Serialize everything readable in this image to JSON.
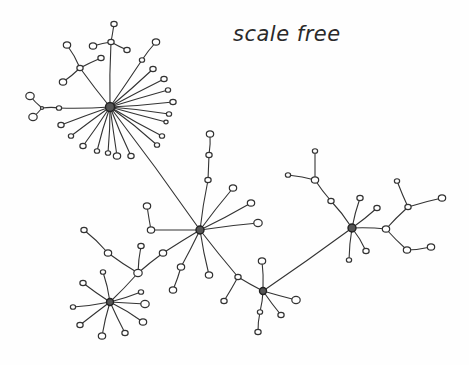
{
  "diagram": {
    "title": "scale free",
    "style": {
      "ink": "#333333",
      "paper": "#fefefe"
    },
    "hubs": [
      {
        "id": "h1",
        "x": 110,
        "y": 107,
        "r": 4.5
      },
      {
        "id": "h2",
        "x": 200,
        "y": 230,
        "r": 4
      },
      {
        "id": "h3",
        "x": 110,
        "y": 302,
        "r": 3.5
      },
      {
        "id": "h4",
        "x": 263,
        "y": 291,
        "r": 3.5
      },
      {
        "id": "h5",
        "x": 352,
        "y": 228,
        "r": 4
      }
    ],
    "nodes": [
      {
        "id": "a1",
        "x": 114,
        "y": 24,
        "r": 3
      },
      {
        "id": "a2",
        "x": 111,
        "y": 42,
        "r": 3
      },
      {
        "id": "a3",
        "x": 93,
        "y": 46,
        "r": 3.5
      },
      {
        "id": "a4",
        "x": 127,
        "y": 50,
        "r": 3
      },
      {
        "id": "a5",
        "x": 67,
        "y": 45,
        "r": 3.5
      },
      {
        "id": "a6",
        "x": 80,
        "y": 68,
        "r": 3
      },
      {
        "id": "a7",
        "x": 101,
        "y": 58,
        "r": 3
      },
      {
        "id": "a8",
        "x": 63,
        "y": 82,
        "r": 3.5
      },
      {
        "id": "a9",
        "x": 156,
        "y": 42,
        "r": 3.5
      },
      {
        "id": "a10",
        "x": 142,
        "y": 60,
        "r": 2.5
      },
      {
        "id": "a11",
        "x": 153,
        "y": 69,
        "r": 3
      },
      {
        "id": "a12",
        "x": 164,
        "y": 79,
        "r": 3
      },
      {
        "id": "a13",
        "x": 168,
        "y": 90,
        "r": 2.5
      },
      {
        "id": "a14",
        "x": 173,
        "y": 102,
        "r": 3
      },
      {
        "id": "a15",
        "x": 169,
        "y": 114,
        "r": 2.5
      },
      {
        "id": "a16",
        "x": 166,
        "y": 122,
        "r": 2
      },
      {
        "id": "a17",
        "x": 162,
        "y": 136,
        "r": 2.5
      },
      {
        "id": "a18",
        "x": 157,
        "y": 145,
        "r": 2.5
      },
      {
        "id": "a19",
        "x": 131,
        "y": 156,
        "r": 3
      },
      {
        "id": "a20",
        "x": 117,
        "y": 156,
        "r": 3.5
      },
      {
        "id": "a21",
        "x": 108,
        "y": 153,
        "r": 2.5
      },
      {
        "id": "a22",
        "x": 97,
        "y": 151,
        "r": 2.5
      },
      {
        "id": "a23",
        "x": 83,
        "y": 146,
        "r": 3
      },
      {
        "id": "a24",
        "x": 71,
        "y": 136,
        "r": 2.5
      },
      {
        "id": "a25",
        "x": 61,
        "y": 125,
        "r": 3
      },
      {
        "id": "a26",
        "x": 59,
        "y": 108,
        "r": 2.5
      },
      {
        "id": "a27",
        "x": 42,
        "y": 108,
        "r": 1.5
      },
      {
        "id": "a28",
        "x": 30,
        "y": 96,
        "r": 4
      },
      {
        "id": "a29",
        "x": 33,
        "y": 117,
        "r": 4
      },
      {
        "id": "b1",
        "x": 210,
        "y": 134,
        "r": 3.5
      },
      {
        "id": "b2",
        "x": 209,
        "y": 155,
        "r": 3
      },
      {
        "id": "b3",
        "x": 208,
        "y": 180,
        "r": 3
      },
      {
        "id": "b4",
        "x": 233,
        "y": 188,
        "r": 3.5
      },
      {
        "id": "b5",
        "x": 251,
        "y": 203,
        "r": 3.5
      },
      {
        "id": "b6",
        "x": 258,
        "y": 223,
        "r": 4
      },
      {
        "id": "b7",
        "x": 147,
        "y": 206,
        "r": 3.5
      },
      {
        "id": "b8",
        "x": 151,
        "y": 230,
        "r": 3.5
      },
      {
        "id": "b9",
        "x": 141,
        "y": 246,
        "r": 2.5
      },
      {
        "id": "b10",
        "x": 163,
        "y": 253,
        "r": 3.5
      },
      {
        "id": "b11",
        "x": 181,
        "y": 267,
        "r": 3.5
      },
      {
        "id": "b12",
        "x": 173,
        "y": 290,
        "r": 3.5
      },
      {
        "id": "b13",
        "x": 209,
        "y": 275,
        "r": 3.5
      },
      {
        "id": "b14",
        "x": 238,
        "y": 277,
        "r": 3
      },
      {
        "id": "b15",
        "x": 224,
        "y": 301,
        "r": 3
      },
      {
        "id": "c1",
        "x": 138,
        "y": 273,
        "r": 4
      },
      {
        "id": "c2",
        "x": 108,
        "y": 253,
        "r": 3.5
      },
      {
        "id": "c3",
        "x": 84,
        "y": 230,
        "r": 3
      },
      {
        "id": "c4",
        "x": 141,
        "y": 246,
        "r": 3
      },
      {
        "id": "c5",
        "x": 103,
        "y": 272,
        "r": 2.5
      },
      {
        "id": "c6",
        "x": 83,
        "y": 283,
        "r": 3
      },
      {
        "id": "c7",
        "x": 73,
        "y": 307,
        "r": 2.5
      },
      {
        "id": "c8",
        "x": 80,
        "y": 325,
        "r": 3
      },
      {
        "id": "c9",
        "x": 102,
        "y": 336,
        "r": 3.5
      },
      {
        "id": "c10",
        "x": 125,
        "y": 333,
        "r": 3
      },
      {
        "id": "c11",
        "x": 143,
        "y": 322,
        "r": 3.5
      },
      {
        "id": "c12",
        "x": 145,
        "y": 304,
        "r": 4
      },
      {
        "id": "c13",
        "x": 141,
        "y": 292,
        "r": 2.5
      },
      {
        "id": "d1",
        "x": 262,
        "y": 261,
        "r": 3.5
      },
      {
        "id": "d2",
        "x": 296,
        "y": 300,
        "r": 4
      },
      {
        "id": "d3",
        "x": 281,
        "y": 315,
        "r": 3
      },
      {
        "id": "d4",
        "x": 260,
        "y": 312,
        "r": 2.5
      },
      {
        "id": "d5",
        "x": 258,
        "y": 332,
        "r": 3
      },
      {
        "id": "e1",
        "x": 315,
        "y": 151,
        "r": 2.5
      },
      {
        "id": "e2",
        "x": 315,
        "y": 180,
        "r": 3.5
      },
      {
        "id": "e3",
        "x": 288,
        "y": 175,
        "r": 2.5
      },
      {
        "id": "e4",
        "x": 331,
        "y": 201,
        "r": 3
      },
      {
        "id": "e5",
        "x": 360,
        "y": 198,
        "r": 3
      },
      {
        "id": "e6",
        "x": 377,
        "y": 208,
        "r": 3
      },
      {
        "id": "e7",
        "x": 386,
        "y": 229,
        "r": 3.5
      },
      {
        "id": "e8",
        "x": 408,
        "y": 207,
        "r": 3
      },
      {
        "id": "e9",
        "x": 397,
        "y": 181,
        "r": 2.5
      },
      {
        "id": "e10",
        "x": 442,
        "y": 198,
        "r": 3.5
      },
      {
        "id": "e11",
        "x": 407,
        "y": 250,
        "r": 3.5
      },
      {
        "id": "e12",
        "x": 431,
        "y": 247,
        "r": 3.5
      },
      {
        "id": "e13",
        "x": 366,
        "y": 251,
        "r": 3
      },
      {
        "id": "e14",
        "x": 349,
        "y": 260,
        "r": 2.5
      }
    ],
    "edges": [
      [
        "h1",
        "a2"
      ],
      [
        "a2",
        "a1"
      ],
      [
        "a2",
        "a3"
      ],
      [
        "a2",
        "a4"
      ],
      [
        "h1",
        "a6"
      ],
      [
        "a6",
        "a5"
      ],
      [
        "a6",
        "a7"
      ],
      [
        "a6",
        "a8"
      ],
      [
        "h1",
        "a10"
      ],
      [
        "a10",
        "a9"
      ],
      [
        "h1",
        "a11"
      ],
      [
        "h1",
        "a12"
      ],
      [
        "h1",
        "a13"
      ],
      [
        "h1",
        "a14"
      ],
      [
        "h1",
        "a15"
      ],
      [
        "h1",
        "a16"
      ],
      [
        "h1",
        "a17"
      ],
      [
        "h1",
        "a18"
      ],
      [
        "h1",
        "a19"
      ],
      [
        "h1",
        "a20"
      ],
      [
        "h1",
        "a21"
      ],
      [
        "h1",
        "a22"
      ],
      [
        "h1",
        "a23"
      ],
      [
        "h1",
        "a24"
      ],
      [
        "h1",
        "a25"
      ],
      [
        "h1",
        "a26"
      ],
      [
        "a26",
        "a27"
      ],
      [
        "a27",
        "a28"
      ],
      [
        "a27",
        "a29"
      ],
      [
        "h1",
        "h2"
      ],
      [
        "h2",
        "b3"
      ],
      [
        "b3",
        "b2"
      ],
      [
        "b2",
        "b1"
      ],
      [
        "h2",
        "b4"
      ],
      [
        "h2",
        "b5"
      ],
      [
        "h2",
        "b6"
      ],
      [
        "h2",
        "b8"
      ],
      [
        "b8",
        "b7"
      ],
      [
        "h2",
        "b10"
      ],
      [
        "b10",
        "c1"
      ],
      [
        "h2",
        "b11"
      ],
      [
        "b11",
        "b12"
      ],
      [
        "h2",
        "b13"
      ],
      [
        "h2",
        "b14"
      ],
      [
        "b14",
        "b15"
      ],
      [
        "b14",
        "h4"
      ],
      [
        "c1",
        "c2"
      ],
      [
        "c2",
        "c3"
      ],
      [
        "c1",
        "c4"
      ],
      [
        "c1",
        "h3"
      ],
      [
        "h3",
        "c5"
      ],
      [
        "h3",
        "c6"
      ],
      [
        "h3",
        "c7"
      ],
      [
        "h3",
        "c8"
      ],
      [
        "h3",
        "c9"
      ],
      [
        "h3",
        "c10"
      ],
      [
        "h3",
        "c11"
      ],
      [
        "h3",
        "c12"
      ],
      [
        "h3",
        "c13"
      ],
      [
        "h4",
        "d1"
      ],
      [
        "h4",
        "d2"
      ],
      [
        "h4",
        "d3"
      ],
      [
        "h4",
        "d4"
      ],
      [
        "d4",
        "d5"
      ],
      [
        "h4",
        "h5"
      ],
      [
        "h5",
        "e4"
      ],
      [
        "e4",
        "e2"
      ],
      [
        "e2",
        "e1"
      ],
      [
        "e2",
        "e3"
      ],
      [
        "h5",
        "e5"
      ],
      [
        "h5",
        "e6"
      ],
      [
        "h5",
        "e7"
      ],
      [
        "e7",
        "e8"
      ],
      [
        "e8",
        "e9"
      ],
      [
        "e8",
        "e10"
      ],
      [
        "e7",
        "e11"
      ],
      [
        "e11",
        "e12"
      ],
      [
        "h5",
        "e13"
      ],
      [
        "h5",
        "e14"
      ]
    ]
  }
}
